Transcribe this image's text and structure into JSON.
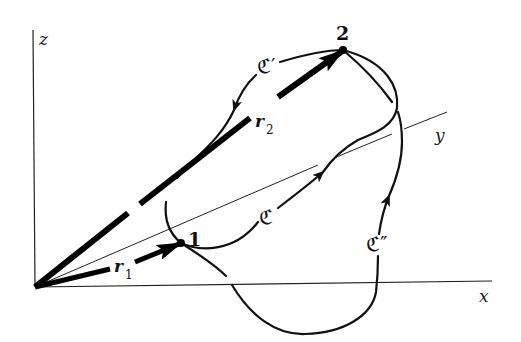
{
  "figure": {
    "type": "3d-coordinate-diagram"
  },
  "axes": {
    "x": {
      "label": "x"
    },
    "y": {
      "label": "y"
    },
    "z": {
      "label": "z"
    }
  },
  "points": {
    "p1": {
      "label": "1"
    },
    "p2": {
      "label": "2"
    }
  },
  "vectors": {
    "r1": {
      "label": "r",
      "subscript": "1",
      "from": "origin",
      "to": "1"
    },
    "r2": {
      "label": "r",
      "subscript": "2",
      "from": "origin",
      "to": "2"
    }
  },
  "curves": {
    "c": {
      "label": "ℭ",
      "direction": "1 → 2"
    },
    "c_prime": {
      "label": "ℭ′",
      "direction": "2 → 1"
    },
    "c_double_prime": {
      "label": "ℭ″",
      "direction": "1 → 2"
    }
  },
  "colors": {
    "ink": "#111111",
    "background": "#ffffff"
  }
}
